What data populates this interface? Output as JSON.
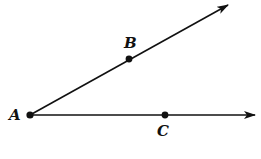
{
  "diagram": {
    "title": "",
    "colors": {
      "stroke": "#111111",
      "background": "#ffffff"
    },
    "points": [
      {
        "id": "A",
        "label": "A",
        "x": 30,
        "y": 115
      },
      {
        "id": "B",
        "label": "B",
        "x": 129,
        "y": 59
      },
      {
        "id": "C",
        "label": "C",
        "x": 165,
        "y": 115
      }
    ],
    "rays": [
      {
        "id": "ray-AB",
        "from": "A",
        "through": "B",
        "end": {
          "x": 228,
          "y": 5
        }
      },
      {
        "id": "ray-AC",
        "from": "A",
        "through": "C",
        "end": {
          "x": 255,
          "y": 115
        }
      }
    ],
    "labels": {
      "A": "A",
      "B": "B",
      "C": "C"
    }
  }
}
